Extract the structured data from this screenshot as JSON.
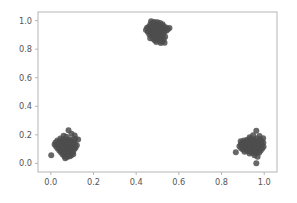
{
  "figure": {
    "width": 297,
    "height": 203,
    "background_color": "#ffffff"
  },
  "chart_data": {
    "type": "scatter",
    "title": "",
    "xlabel": "",
    "ylabel": "",
    "xlim": [
      -0.06,
      1.06
    ],
    "ylim": [
      -0.06,
      1.06
    ],
    "grid": false,
    "legend": null,
    "marker": {
      "color": "#4d4d4d",
      "size": 3.0,
      "shape": "circle",
      "alpha": 0.85
    },
    "axes": {
      "xticks": [
        0.0,
        0.2,
        0.4,
        0.6,
        0.8,
        1.0
      ],
      "xticklabels": [
        "0.0",
        "0.2",
        "0.4",
        "0.6",
        "0.8",
        "1.0"
      ],
      "yticks": [
        0.0,
        0.2,
        0.4,
        0.6,
        0.8,
        1.0
      ],
      "yticklabels": [
        "0.0",
        "0.2",
        "0.4",
        "0.6",
        "0.8",
        "1.0"
      ],
      "spine_color": "#b5b5b5",
      "tick_label_color": "#555555"
    },
    "clusters": [
      {
        "name": "cluster-top-center",
        "center": [
          0.5,
          0.94
        ],
        "points": [
          [
            0.47,
            0.995
          ],
          [
            0.486,
            0.99
          ],
          [
            0.5,
            0.988
          ],
          [
            0.512,
            0.983
          ],
          [
            0.495,
            0.978
          ],
          [
            0.48,
            0.975
          ],
          [
            0.466,
            0.972
          ],
          [
            0.523,
            0.974
          ],
          [
            0.54,
            0.952
          ],
          [
            0.556,
            0.948
          ],
          [
            0.505,
            0.968
          ],
          [
            0.492,
            0.963
          ],
          [
            0.476,
            0.96
          ],
          [
            0.46,
            0.957
          ],
          [
            0.451,
            0.95
          ],
          [
            0.463,
            0.944
          ],
          [
            0.478,
            0.947
          ],
          [
            0.49,
            0.952
          ],
          [
            0.503,
            0.955
          ],
          [
            0.516,
            0.958
          ],
          [
            0.528,
            0.952
          ],
          [
            0.534,
            0.94
          ],
          [
            0.521,
            0.936
          ],
          [
            0.508,
            0.94
          ],
          [
            0.495,
            0.938
          ],
          [
            0.483,
            0.934
          ],
          [
            0.47,
            0.932
          ],
          [
            0.457,
            0.928
          ],
          [
            0.446,
            0.934
          ],
          [
            0.455,
            0.92
          ],
          [
            0.468,
            0.918
          ],
          [
            0.481,
            0.922
          ],
          [
            0.494,
            0.925
          ],
          [
            0.506,
            0.922
          ],
          [
            0.519,
            0.918
          ],
          [
            0.531,
            0.922
          ],
          [
            0.541,
            0.928
          ],
          [
            0.527,
            0.908
          ],
          [
            0.514,
            0.905
          ],
          [
            0.501,
            0.908
          ],
          [
            0.488,
            0.91
          ],
          [
            0.475,
            0.906
          ],
          [
            0.462,
            0.902
          ],
          [
            0.472,
            0.893
          ],
          [
            0.486,
            0.896
          ],
          [
            0.499,
            0.894
          ],
          [
            0.512,
            0.89
          ],
          [
            0.524,
            0.893
          ],
          [
            0.536,
            0.886
          ],
          [
            0.505,
            0.88
          ],
          [
            0.492,
            0.876
          ],
          [
            0.479,
            0.872
          ],
          [
            0.466,
            0.876
          ],
          [
            0.517,
            0.874
          ],
          [
            0.529,
            0.868
          ],
          [
            0.5,
            0.866
          ],
          [
            0.487,
            0.862
          ],
          [
            0.51,
            0.858
          ],
          [
            0.523,
            0.852
          ],
          [
            0.494,
            0.85
          ],
          [
            0.533,
            0.844
          ],
          [
            0.515,
            0.843
          ],
          [
            0.504,
            0.93
          ],
          [
            0.49,
            0.944
          ],
          [
            0.513,
            0.946
          ],
          [
            0.477,
            0.985
          ],
          [
            0.528,
            0.962
          ],
          [
            0.548,
            0.938
          ]
        ]
      },
      {
        "name": "cluster-bottom-left",
        "center": [
          0.07,
          0.12
        ],
        "points": [
          [
            0.083,
            0.232
          ],
          [
            0.097,
            0.208
          ],
          [
            0.112,
            0.196
          ],
          [
            0.06,
            0.193
          ],
          [
            0.073,
            0.186
          ],
          [
            0.128,
            0.168
          ],
          [
            0.115,
            0.172
          ],
          [
            0.045,
            0.175
          ],
          [
            0.058,
            0.17
          ],
          [
            0.071,
            0.166
          ],
          [
            0.085,
            0.17
          ],
          [
            0.098,
            0.164
          ],
          [
            0.031,
            0.16
          ],
          [
            0.044,
            0.156
          ],
          [
            0.057,
            0.158
          ],
          [
            0.07,
            0.153
          ],
          [
            0.083,
            0.155
          ],
          [
            0.096,
            0.15
          ],
          [
            0.109,
            0.154
          ],
          [
            0.022,
            0.146
          ],
          [
            0.035,
            0.143
          ],
          [
            0.048,
            0.146
          ],
          [
            0.061,
            0.141
          ],
          [
            0.074,
            0.144
          ],
          [
            0.087,
            0.14
          ],
          [
            0.1,
            0.143
          ],
          [
            0.113,
            0.138
          ],
          [
            0.018,
            0.132
          ],
          [
            0.031,
            0.129
          ],
          [
            0.044,
            0.132
          ],
          [
            0.057,
            0.127
          ],
          [
            0.07,
            0.13
          ],
          [
            0.083,
            0.126
          ],
          [
            0.096,
            0.129
          ],
          [
            0.109,
            0.124
          ],
          [
            0.122,
            0.128
          ],
          [
            0.025,
            0.118
          ],
          [
            0.038,
            0.115
          ],
          [
            0.051,
            0.118
          ],
          [
            0.064,
            0.113
          ],
          [
            0.077,
            0.116
          ],
          [
            0.09,
            0.112
          ],
          [
            0.103,
            0.115
          ],
          [
            0.116,
            0.11
          ],
          [
            0.032,
            0.104
          ],
          [
            0.045,
            0.101
          ],
          [
            0.058,
            0.104
          ],
          [
            0.071,
            0.099
          ],
          [
            0.084,
            0.102
          ],
          [
            0.097,
            0.098
          ],
          [
            0.11,
            0.101
          ],
          [
            0.04,
            0.09
          ],
          [
            0.053,
            0.087
          ],
          [
            0.066,
            0.09
          ],
          [
            0.079,
            0.085
          ],
          [
            0.092,
            0.088
          ],
          [
            0.105,
            0.084
          ],
          [
            0.048,
            0.076
          ],
          [
            0.061,
            0.073
          ],
          [
            0.074,
            0.076
          ],
          [
            0.087,
            0.071
          ],
          [
            0.1,
            0.074
          ],
          [
            0.056,
            0.062
          ],
          [
            0.069,
            0.059
          ],
          [
            0.082,
            0.062
          ],
          [
            0.095,
            0.057
          ],
          [
            0.064,
            0.048
          ],
          [
            0.077,
            0.045
          ],
          [
            0.002,
            0.058
          ],
          [
            0.068,
            0.036
          ],
          [
            0.09,
            0.05
          ],
          [
            0.105,
            0.065
          ]
        ]
      },
      {
        "name": "cluster-bottom-right",
        "center": [
          0.94,
          0.13
        ],
        "points": [
          [
            0.963,
            0.228
          ],
          [
            0.978,
            0.192
          ],
          [
            0.948,
            0.198
          ],
          [
            0.932,
            0.184
          ],
          [
            0.995,
            0.176
          ],
          [
            0.98,
            0.17
          ],
          [
            0.965,
            0.174
          ],
          [
            0.95,
            0.168
          ],
          [
            0.935,
            0.171
          ],
          [
            0.92,
            0.165
          ],
          [
            0.905,
            0.16
          ],
          [
            0.89,
            0.156
          ],
          [
            0.988,
            0.158
          ],
          [
            0.973,
            0.154
          ],
          [
            0.958,
            0.157
          ],
          [
            0.943,
            0.152
          ],
          [
            0.928,
            0.155
          ],
          [
            0.913,
            0.15
          ],
          [
            0.898,
            0.146
          ],
          [
            0.996,
            0.144
          ],
          [
            0.981,
            0.141
          ],
          [
            0.966,
            0.144
          ],
          [
            0.951,
            0.139
          ],
          [
            0.936,
            0.142
          ],
          [
            0.921,
            0.137
          ],
          [
            0.906,
            0.14
          ],
          [
            0.891,
            0.135
          ],
          [
            0.989,
            0.13
          ],
          [
            0.974,
            0.127
          ],
          [
            0.959,
            0.13
          ],
          [
            0.944,
            0.125
          ],
          [
            0.929,
            0.128
          ],
          [
            0.914,
            0.123
          ],
          [
            0.899,
            0.126
          ],
          [
            0.884,
            0.121
          ],
          [
            0.997,
            0.116
          ],
          [
            0.982,
            0.113
          ],
          [
            0.967,
            0.116
          ],
          [
            0.952,
            0.111
          ],
          [
            0.937,
            0.114
          ],
          [
            0.922,
            0.109
          ],
          [
            0.907,
            0.112
          ],
          [
            0.892,
            0.107
          ],
          [
            0.99,
            0.102
          ],
          [
            0.975,
            0.099
          ],
          [
            0.96,
            0.102
          ],
          [
            0.945,
            0.097
          ],
          [
            0.93,
            0.1
          ],
          [
            0.915,
            0.095
          ],
          [
            0.9,
            0.098
          ],
          [
            0.983,
            0.088
          ],
          [
            0.968,
            0.085
          ],
          [
            0.953,
            0.088
          ],
          [
            0.938,
            0.083
          ],
          [
            0.923,
            0.086
          ],
          [
            0.908,
            0.081
          ],
          [
            0.867,
            0.078
          ],
          [
            0.976,
            0.074
          ],
          [
            0.961,
            0.071
          ],
          [
            0.946,
            0.074
          ],
          [
            0.931,
            0.069
          ],
          [
            0.954,
            0.058
          ],
          [
            0.969,
            0.046
          ],
          [
            0.963,
            0.002
          ],
          [
            0.94,
            0.16
          ],
          [
            0.955,
            0.145
          ],
          [
            0.925,
            0.132
          ],
          [
            0.97,
            0.12
          ]
        ]
      }
    ]
  }
}
